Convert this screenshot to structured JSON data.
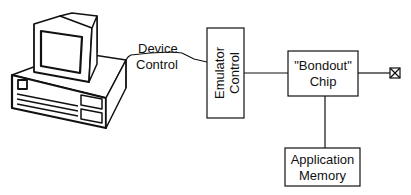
{
  "diagram": {
    "nodes": {
      "computer": {
        "label": ""
      },
      "cable": {
        "label_line1": "Device",
        "label_line2": "Control"
      },
      "emulator": {
        "label_line1": "Emulator",
        "label_line2": "Control"
      },
      "bondout": {
        "label_line1": "\"Bondout\"",
        "label_line2": "Chip"
      },
      "memory": {
        "label_line1": "Application",
        "label_line2": "Memory"
      },
      "pin": {
        "label": ""
      }
    },
    "edges": [
      {
        "from": "computer",
        "to": "emulator",
        "label": "Device Control"
      },
      {
        "from": "emulator",
        "to": "bondout"
      },
      {
        "from": "bondout",
        "to": "pin"
      },
      {
        "from": "bondout",
        "to": "memory"
      }
    ],
    "colors": {
      "stroke": "#111111",
      "background": "#ffffff"
    }
  }
}
